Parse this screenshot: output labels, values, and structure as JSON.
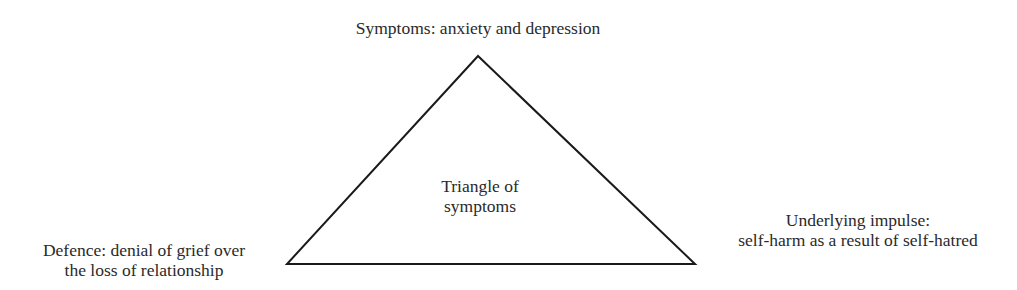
{
  "diagram": {
    "type": "triangle",
    "stroke_color": "#1a1a1a",
    "vertices": {
      "apex": [
        478,
        56
      ],
      "bottom_left": [
        287,
        264
      ],
      "bottom_right": [
        695,
        264
      ]
    },
    "center_label": {
      "line1": "Triangle of",
      "line2": "symptoms"
    },
    "top_label": "Symptoms: anxiety and depression",
    "left_label": {
      "line1": "Defence: denial of grief over",
      "line2": "the loss of relationship"
    },
    "right_label": {
      "line1": "Underlying impulse:",
      "line2": "self-harm as a result of self-hatred"
    }
  }
}
